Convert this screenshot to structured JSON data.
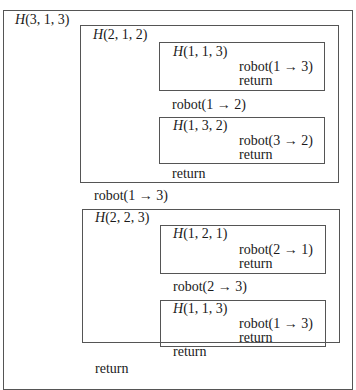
{
  "diagram": {
    "top_fragment": "to the right",
    "outer": {
      "fn": "H",
      "args": "(3, 1, 3)",
      "children": [
        {
          "fn": "H",
          "args": "(2, 1, 2)",
          "inner_a": {
            "fn": "H",
            "args": "(1, 1, 3)",
            "move": "robot(1 → 3)",
            "ret": "return"
          },
          "move": "robot(1 → 2)",
          "inner_b": {
            "fn": "H",
            "args": "(1, 3, 2)",
            "move": "robot(3 → 2)",
            "ret": "return"
          },
          "ret": "return"
        },
        {
          "move": "robot(1 → 3)"
        },
        {
          "fn": "H",
          "args": "(2, 2, 3)",
          "inner_a": {
            "fn": "H",
            "args": "(1, 2, 1)",
            "move": "robot(2 → 1)",
            "ret": "return"
          },
          "move": "robot(2 → 3)",
          "inner_b": {
            "fn": "H",
            "args": "(1, 1, 3)",
            "move": "robot(1 → 3)",
            "ret": "return"
          },
          "ret": "return"
        }
      ],
      "ret": "return"
    }
  },
  "colors": {
    "border": "#555555",
    "text": "#1a1a1a",
    "background": "#ffffff"
  }
}
